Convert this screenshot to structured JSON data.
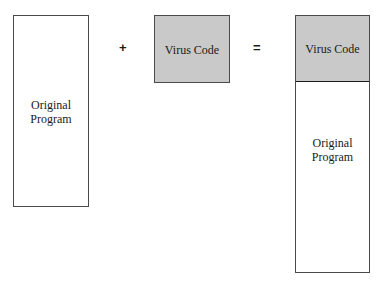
{
  "diagram": {
    "left_box": {
      "line1": "Original",
      "line2": "Program"
    },
    "plus_operator": "+",
    "middle_box": {
      "label": "Virus Code"
    },
    "equals_operator": "=",
    "result": {
      "top": {
        "label": "Virus Code"
      },
      "bottom": {
        "line1": "Original",
        "line2": "Program"
      }
    },
    "colors": {
      "virus_fill": "#c9c9c9",
      "border": "#4a4a4a",
      "background": "#ffffff"
    }
  }
}
